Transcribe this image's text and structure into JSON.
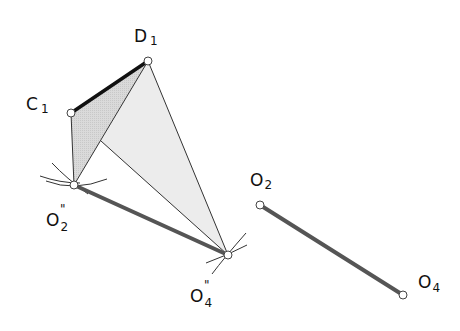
{
  "diagram": {
    "type": "linkage-construction",
    "colors": {
      "shade_dark": "#d6d6d6",
      "shade_light": "#ececec",
      "thin_line": "#333333",
      "coupler": "#111111",
      "link": "#555555",
      "pivot_fill": "#ffffff",
      "pivot_stroke": "#444444"
    },
    "points": {
      "C1": {
        "x": 71,
        "y": 113,
        "label": "C",
        "sub": "1",
        "prime": ""
      },
      "D1": {
        "x": 148,
        "y": 61,
        "label": "D",
        "sub": "1",
        "prime": ""
      },
      "O2pp": {
        "x": 74,
        "y": 185,
        "label": "O",
        "sub": "2",
        "prime": "\""
      },
      "O4pp": {
        "x": 228,
        "y": 255,
        "label": "O",
        "sub": "4",
        "prime": "\""
      },
      "O2": {
        "x": 260,
        "y": 205,
        "label": "O",
        "sub": "2",
        "prime": ""
      },
      "O4": {
        "x": 403,
        "y": 295,
        "label": "O",
        "sub": "4",
        "prime": ""
      },
      "P": {
        "x": 101,
        "y": 141
      }
    },
    "labels": {
      "C1": {
        "main": "C",
        "sub": "1"
      },
      "D1": {
        "main": "D",
        "sub": "1"
      },
      "O2pp": {
        "main": "O",
        "sub": "2",
        "prime": "\""
      },
      "O4pp": {
        "main": "O",
        "sub": "4",
        "prime": "\""
      },
      "O2": {
        "main": "O",
        "sub": "2"
      },
      "O4": {
        "main": "O",
        "sub": "4"
      }
    }
  }
}
